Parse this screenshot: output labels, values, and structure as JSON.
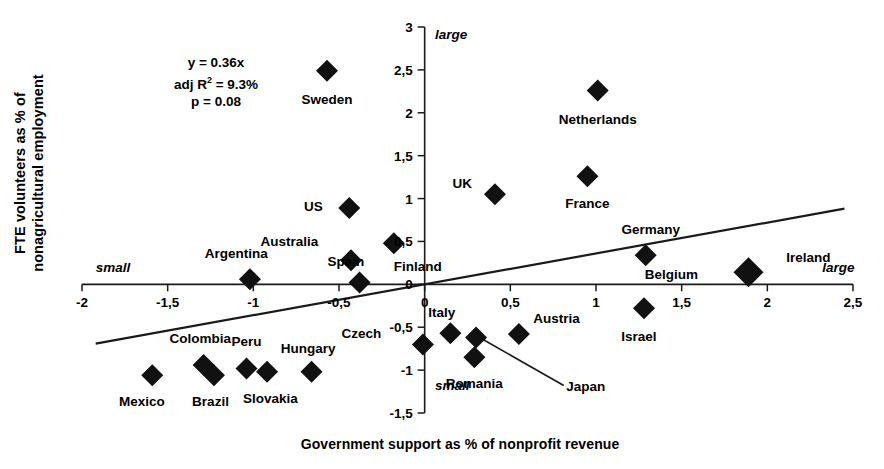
{
  "chart_data": {
    "type": "scatter",
    "title": "",
    "xlabel": "Government support as % of nonprofit revenue",
    "ylabel_line1": "FTE volunteers as % of",
    "ylabel_line2": "nonagricultural",
    "ylabel_line3": "employment",
    "ylabel_full": "FTE volunteers as % of nonagricultural employment",
    "xlim": [
      -2,
      2.5
    ],
    "ylim": [
      -1.5,
      3
    ],
    "grid": false,
    "legend": "none",
    "xticks": [
      "-2",
      "-1,5",
      "-1",
      "-0,5",
      "0",
      "0,5",
      "1",
      "1,5",
      "2",
      "2,5"
    ],
    "xtick_values": [
      -2,
      -1.5,
      -1,
      -0.5,
      0,
      0.5,
      1,
      1.5,
      2,
      2.5
    ],
    "yticks": [
      "3",
      "2,5",
      "2",
      "1,5",
      "1",
      "0,5",
      "0",
      "-0,5",
      "-1",
      "-1,5"
    ],
    "ytick_values": [
      3,
      2.5,
      2,
      1.5,
      1,
      0.5,
      0,
      -0.5,
      -1,
      -1.5
    ],
    "qualifiers": [
      {
        "text": "large",
        "axis": "y",
        "position": "top",
        "x": 0.06,
        "y": 2.9
      },
      {
        "text": "small",
        "axis": "y",
        "position": "bottom",
        "x": 0.06,
        "y": -1.2
      },
      {
        "text": "small",
        "axis": "x",
        "position": "left",
        "x": -1.92,
        "y": 0.18
      },
      {
        "text": "large",
        "axis": "x",
        "position": "right",
        "x": 2.32,
        "y": 0.18
      }
    ],
    "annotation": {
      "equation": "y = 0.36x",
      "adj_r2_label": "adj R",
      "adj_r2_sup": "2",
      "adj_r2_value": " = 9.3%",
      "pvalue": "p = 0.08"
    },
    "trendline": {
      "slope": 0.36,
      "intercept": 0.0,
      "x_start": -1.92,
      "x_end": 2.45
    },
    "points": [
      {
        "name": "Sweden",
        "x": -0.57,
        "y": 2.49,
        "label_dx": 0,
        "label_dy": -0.33
      },
      {
        "name": "Netherlands",
        "x": 1.01,
        "y": 2.26,
        "label_dx": 0,
        "label_dy": -0.33
      },
      {
        "name": "France",
        "x": 0.95,
        "y": 1.26,
        "label_dx": 0,
        "label_dy": -0.31
      },
      {
        "name": "UK",
        "x": 0.41,
        "y": 1.05,
        "label_dx": -0.19,
        "label_dy": 0.13
      },
      {
        "name": "US",
        "x": -0.44,
        "y": 0.89,
        "label_dx": -0.21,
        "label_dy": 0.02
      },
      {
        "name": "Australia",
        "x": -0.43,
        "y": 0.28,
        "label_dx": -0.36,
        "label_dy": 0.22
      },
      {
        "name": "Finland",
        "x": -0.18,
        "y": 0.48,
        "label_dx": 0.14,
        "label_dy": -0.27
      },
      {
        "name": "Spain",
        "x": -0.38,
        "y": 0.02,
        "label_dx": -0.08,
        "label_dy": 0.25
      },
      {
        "name": "Germany",
        "x": 1.29,
        "y": 0.34,
        "label_dx": 0.03,
        "label_dy": 0.31
      },
      {
        "name": "Belgium",
        "x": 1.89,
        "y": 0.14,
        "label_dx": -0.45,
        "label_dy": -0.02
      },
      {
        "name": "Ireland",
        "x": 1.89,
        "y": 0.14,
        "label_dx": 0.35,
        "label_dy": 0.18
      },
      {
        "name": "Argentina",
        "x": -1.02,
        "y": 0.06,
        "label_dx": -0.08,
        "label_dy": 0.31
      },
      {
        "name": "Israel",
        "x": 1.28,
        "y": -0.28,
        "label_dx": -0.03,
        "label_dy": -0.32
      },
      {
        "name": "Austria",
        "x": 0.55,
        "y": -0.58,
        "label_dx": 0.22,
        "label_dy": 0.19
      },
      {
        "name": "Italy",
        "x": 0.15,
        "y": -0.57,
        "label_dx": -0.05,
        "label_dy": 0.25
      },
      {
        "name": "Czech",
        "x": -0.01,
        "y": -0.7,
        "label_dx": -0.36,
        "label_dy": 0.13
      },
      {
        "name": "Japan",
        "x": 0.3,
        "y": -0.62,
        "label_dx": 0.64,
        "label_dy": -0.56
      },
      {
        "name": "Romania",
        "x": 0.29,
        "y": -0.85,
        "label_dx": 0.0,
        "label_dy": -0.3
      },
      {
        "name": "Hungary",
        "x": -0.66,
        "y": -1.02,
        "label_dx": -0.02,
        "label_dy": 0.28
      },
      {
        "name": "Slovakia",
        "x": -0.92,
        "y": -1.02,
        "label_dx": 0.02,
        "label_dy": -0.3
      },
      {
        "name": "Peru",
        "x": -1.04,
        "y": -0.98,
        "label_dx": 0.0,
        "label_dy": 0.32
      },
      {
        "name": "Brazil",
        "x": -1.23,
        "y": -1.06,
        "label_dx": -0.02,
        "label_dy": -0.3
      },
      {
        "name": "Colombia",
        "x": -1.29,
        "y": -0.94,
        "label_dx": -0.02,
        "label_dy": 0.32
      },
      {
        "name": "Mexico",
        "x": -1.59,
        "y": -1.06,
        "label_dx": -0.06,
        "label_dy": -0.3
      }
    ],
    "connector": {
      "from": "Japan-label",
      "to_point": "Japan"
    }
  }
}
